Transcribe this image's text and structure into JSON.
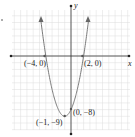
{
  "chart_data": {
    "type": "line",
    "title": "",
    "xlabel": "x",
    "ylabel": "y",
    "function": "y = x^2 + 2x - 8",
    "xlim": [
      -9,
      9
    ],
    "ylim": [
      -11,
      7
    ],
    "grid": true,
    "series": [
      {
        "name": "parabola",
        "x": [
          -5.3,
          -5,
          -4,
          -3,
          -2,
          -1,
          0,
          1,
          2,
          3,
          3.3
        ],
        "values": [
          7.5,
          7,
          0,
          -5,
          -8,
          -9,
          -8,
          -5,
          0,
          7,
          9.5
        ]
      }
    ],
    "annotations": [
      {
        "label": "(−4, 0)",
        "x": -4,
        "y": 0
      },
      {
        "label": "(2, 0)",
        "x": 2,
        "y": 0
      },
      {
        "label": "(0, −8)",
        "x": 0,
        "y": -8
      },
      {
        "label": "(−1, −9)",
        "x": -1,
        "y": -9
      }
    ]
  },
  "labels": {
    "x_axis": "x",
    "y_axis": "y",
    "p1": "(−4, 0)",
    "p2": "(2, 0)",
    "p3": "(0, −8)",
    "p4": "(−1, −9)"
  },
  "colors": {
    "curve": "#7a7a7a",
    "axis": "#333333",
    "grid": "#dcdcdc",
    "point": "#555555"
  }
}
